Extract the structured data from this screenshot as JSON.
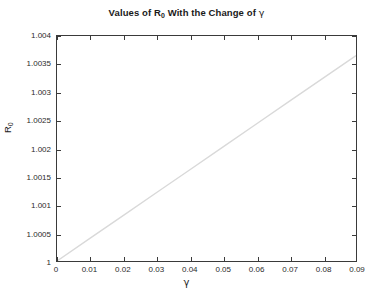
{
  "chart_data": {
    "type": "line",
    "title": "Values of R0 With the Change of γ",
    "title_prefix": "Values of R",
    "title_sub": "0",
    "title_mid": " With the Change of ",
    "title_gamma": "γ",
    "xlabel": "γ",
    "ylabel_prefix": "R",
    "ylabel_sub": "0",
    "ylabel": "R0",
    "xlim": [
      0,
      0.09
    ],
    "ylim": [
      1,
      1.004
    ],
    "grid": false,
    "legend": null,
    "line_color": "#d9d9d9",
    "axis_color": "#3a3a3a",
    "background": "#ffffff",
    "xticks": [
      "0",
      "0.01",
      "0.02",
      "0.03",
      "0.04",
      "0.05",
      "0.06",
      "0.07",
      "0.08",
      "0.09"
    ],
    "xtick_values": [
      0,
      0.01,
      0.02,
      0.03,
      0.04,
      0.05,
      0.06,
      0.07,
      0.08,
      0.09
    ],
    "yticks": [
      "1",
      "1.0005",
      "1.001",
      "1.0015",
      "1.002",
      "1.0025",
      "1.003",
      "1.0035",
      "1.004"
    ],
    "ytick_values": [
      1,
      1.0005,
      1.001,
      1.0015,
      1.002,
      1.0025,
      1.003,
      1.0035,
      1.004
    ],
    "series": [
      {
        "name": "R0",
        "x": [
          0,
          0.01,
          0.02,
          0.03,
          0.04,
          0.05,
          0.06,
          0.07,
          0.08,
          0.09
        ],
        "values": [
          1.0,
          1.000406,
          1.000812,
          1.001217,
          1.001623,
          1.002029,
          1.002435,
          1.002841,
          1.003246,
          1.003652
        ]
      }
    ]
  }
}
